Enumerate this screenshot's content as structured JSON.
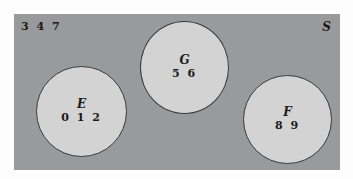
{
  "diagram": {
    "type": "venn",
    "colors": {
      "universe_fill": "#999a9b",
      "set_fill": "#d3d3d3",
      "outline": "#3a3a3a",
      "text": "#1a1a1a"
    },
    "universe": {
      "label": "S",
      "outside_elements": "3 4 7"
    },
    "sets": [
      {
        "label": "E",
        "elements": "0 1 2"
      },
      {
        "label": "G",
        "elements": "5 6"
      },
      {
        "label": "F",
        "elements": "8 9"
      }
    ]
  }
}
